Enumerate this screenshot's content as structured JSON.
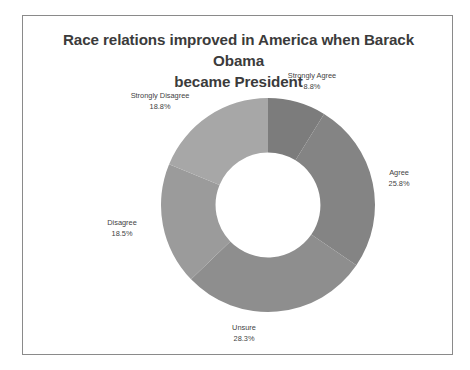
{
  "chart_data": {
    "type": "pie",
    "variant": "donut",
    "title": "Race relations improved in America when Barack Obama became President",
    "title_lines": [
      "Race relations improved in America when Barack Obama",
      "became President"
    ],
    "xlabel": "",
    "ylabel": "",
    "grid": false,
    "legend": "none",
    "labels_position": "outside",
    "start_angle_deg": 0,
    "direction": "clockwise",
    "inner_radius_ratio": 0.49,
    "categories": [
      "Strongly Agree",
      "Agree",
      "Unsure",
      "Disagree",
      "Strongly Disagree"
    ],
    "values": [
      8.8,
      25.8,
      28.3,
      18.5,
      18.8
    ],
    "value_unit": "%",
    "slices": [
      {
        "label": "Strongly Agree",
        "value": 8.8,
        "display": "8.8%",
        "color": "#7c7c7c"
      },
      {
        "label": "Agree",
        "value": 25.8,
        "display": "25.8%",
        "color": "#848484"
      },
      {
        "label": "Unsure",
        "value": 28.3,
        "display": "28.3%",
        "color": "#8e8e8e"
      },
      {
        "label": "Disagree",
        "value": 18.5,
        "display": "18.5%",
        "color": "#9b9b9b"
      },
      {
        "label": "Strongly Disagree",
        "value": 18.8,
        "display": "18.8%",
        "color": "#a7a7a7"
      }
    ]
  },
  "colors": {
    "frame_border": "#8a8a8a",
    "background": "#ffffff",
    "title_text": "#3b3b3b",
    "label_text": "#3f3f3f",
    "donut_hole": "#ffffff"
  }
}
